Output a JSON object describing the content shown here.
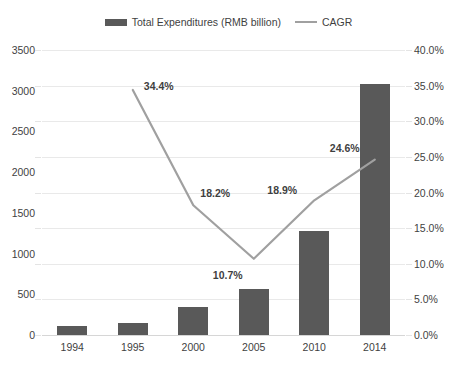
{
  "legend": {
    "items": [
      {
        "label": "Total Expenditures (RMB billion)",
        "marker": "bar-swatch",
        "color": "#595959"
      },
      {
        "label": "CAGR",
        "marker": "line-swatch",
        "color": "#a0a0a0"
      }
    ]
  },
  "axes": {
    "left_ticks": [
      "3500",
      "3000",
      "2500",
      "2000",
      "1500",
      "1000",
      "500",
      "0"
    ],
    "right_ticks": [
      "40.0%",
      "35.0%",
      "30.0%",
      "25.0%",
      "20.0%",
      "15.0%",
      "10.0%",
      "5.0%",
      "0.0%"
    ]
  },
  "chart_data": {
    "type": "bar",
    "title": "",
    "subtitle": "",
    "xlabel": "",
    "ylabel": "",
    "y2label": "",
    "grid": true,
    "legend_position": "top-center",
    "categories": [
      "1994",
      "1995",
      "2000",
      "2005",
      "2010",
      "2014"
    ],
    "ylim": [
      0,
      3500
    ],
    "y2lim": [
      0,
      40
    ],
    "ytick_step": 500,
    "y2tick_step": 5,
    "series": [
      {
        "name": "Total Expenditures (RMB billion)",
        "type": "bar",
        "axis": "left",
        "color": "#595959",
        "values": [
          110,
          145,
          340,
          560,
          1280,
          3080
        ]
      },
      {
        "name": "CAGR",
        "type": "line",
        "axis": "right",
        "color": "#a0a0a0",
        "x": [
          "1995",
          "2000",
          "2005",
          "2010",
          "2014"
        ],
        "values": [
          34.4,
          18.2,
          10.7,
          18.9,
          24.6
        ],
        "labels": [
          "34.4%",
          "18.2%",
          "10.7%",
          "18.9%",
          "24.6%"
        ]
      }
    ]
  }
}
